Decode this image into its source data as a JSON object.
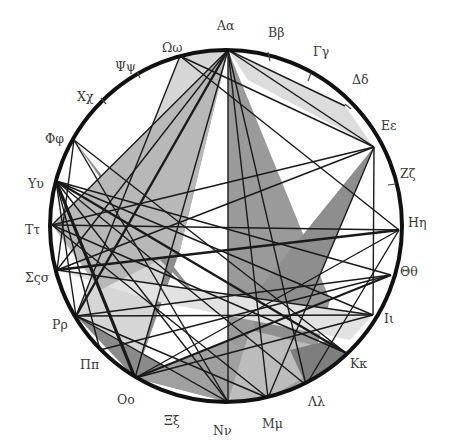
{
  "diagram": {
    "circle": {
      "cx": 226,
      "cy": 226,
      "r": 176,
      "stroke": "#111111",
      "stroke_width": 4
    },
    "labels": [
      {
        "text": "Αα",
        "x": 217,
        "y": 18
      },
      {
        "text": "Ββ",
        "x": 268,
        "y": 25
      },
      {
        "text": "Γγ",
        "x": 313,
        "y": 44
      },
      {
        "text": "Δδ",
        "x": 352,
        "y": 72
      },
      {
        "text": "Εε",
        "x": 381,
        "y": 118
      },
      {
        "text": "Ζζ",
        "x": 400,
        "y": 166
      },
      {
        "text": "Ηη",
        "x": 408,
        "y": 215
      },
      {
        "text": "Θθ",
        "x": 400,
        "y": 264
      },
      {
        "text": "Ιι",
        "x": 384,
        "y": 311
      },
      {
        "text": "Κκ",
        "x": 350,
        "y": 356
      },
      {
        "text": "Λλ",
        "x": 308,
        "y": 394
      },
      {
        "text": "Μμ",
        "x": 262,
        "y": 416
      },
      {
        "text": "Νν",
        "x": 213,
        "y": 423
      },
      {
        "text": "Ξξ",
        "x": 164,
        "y": 413
      },
      {
        "text": "Οο",
        "x": 117,
        "y": 392
      },
      {
        "text": "Ππ",
        "x": 80,
        "y": 357
      },
      {
        "text": "Ρρ",
        "x": 52,
        "y": 317
      },
      {
        "text": "Σςσ",
        "x": 25,
        "y": 270
      },
      {
        "text": "Ττ",
        "x": 25,
        "y": 222
      },
      {
        "text": "Υυ",
        "x": 28,
        "y": 176
      },
      {
        "text": "Φφ",
        "x": 45,
        "y": 131
      },
      {
        "text": "Χχ",
        "x": 77,
        "y": 89
      },
      {
        "text": "Ψψ",
        "x": 115,
        "y": 59
      },
      {
        "text": "Ωω",
        "x": 162,
        "y": 40
      }
    ],
    "ticks": [
      {
        "x1": 268,
        "y1": 52,
        "x2": 270,
        "y2": 61
      },
      {
        "x1": 311,
        "y1": 73,
        "x2": 308,
        "y2": 81
      },
      {
        "x1": 345,
        "y1": 104,
        "x2": 351,
        "y2": 109
      },
      {
        "x1": 388,
        "y1": 185,
        "x2": 396,
        "y2": 184
      },
      {
        "x1": 101,
        "y1": 98,
        "x2": 106,
        "y2": 104
      },
      {
        "x1": 137,
        "y1": 72,
        "x2": 140,
        "y2": 78
      }
    ],
    "vertices": {
      "A": [
        228,
        50
      ],
      "Om": [
        180,
        56
      ],
      "Ph": [
        74,
        140
      ],
      "Y": [
        56,
        181
      ],
      "T": [
        52,
        225
      ],
      "S": [
        57,
        270
      ],
      "R": [
        76,
        316
      ],
      "P": [
        100,
        350
      ],
      "O": [
        135,
        378
      ],
      "N": [
        228,
        402
      ],
      "M": [
        268,
        398
      ],
      "L": [
        306,
        385
      ],
      "K": [
        346,
        353
      ],
      "I": [
        373,
        315
      ],
      "Th": [
        391,
        275
      ],
      "H": [
        399,
        230
      ],
      "E": [
        374,
        147
      ],
      "D": [
        345,
        106
      ]
    },
    "polygons": [
      {
        "points": "228,50 345,106 374,147 248,80",
        "fill": "#dcdcdc"
      },
      {
        "points": "180,56 228,50 135,378 76,316",
        "fill": "#d6d6d6"
      },
      {
        "points": "228,50 228,402 306,385 330,300",
        "fill": "#9a9a9a"
      },
      {
        "points": "228,50 135,378 180,250",
        "fill": "#8c8c8c"
      },
      {
        "points": "74,140 200,300 150,250",
        "fill": "#8e8e8e"
      },
      {
        "points": "374,147 268,398 250,300",
        "fill": "#8e8e8e"
      },
      {
        "points": "57,270 373,315 350,340 150,300",
        "fill": "#e2e2e2"
      },
      {
        "points": "76,316 228,402 135,378",
        "fill": "#8a8a8a"
      },
      {
        "points": "135,378 228,402 268,398 306,385 228,340",
        "fill": "#a0a0a0"
      },
      {
        "points": "52,225 228,50 180,250 100,290",
        "fill": "#b8b8b8"
      },
      {
        "points": "228,402 268,398 346,353 250,330",
        "fill": "#bcbcbc"
      },
      {
        "points": "306,385 346,353 330,340 290,350",
        "fill": "#7e7e7e"
      }
    ],
    "chords": [
      {
        "a": "A",
        "b": "E",
        "w": 1.4
      },
      {
        "a": "A",
        "b": "D",
        "w": 1.4
      },
      {
        "a": "A",
        "b": "O",
        "w": 1.4
      },
      {
        "a": "A",
        "b": "N",
        "w": 1.4
      },
      {
        "a": "A",
        "b": "M",
        "w": 1.4
      },
      {
        "a": "A",
        "b": "L",
        "w": 1.4
      },
      {
        "a": "A",
        "b": "R",
        "w": 2.4
      },
      {
        "a": "A",
        "b": "T",
        "w": 1.4
      },
      {
        "a": "A",
        "b": "S",
        "w": 1.4
      },
      {
        "a": "Om",
        "b": "R",
        "w": 1.4
      },
      {
        "a": "Om",
        "b": "E",
        "w": 1.4
      },
      {
        "a": "Ph",
        "b": "K",
        "w": 1.4
      },
      {
        "a": "Y",
        "b": "O",
        "w": 3.2
      },
      {
        "a": "Y",
        "b": "K",
        "w": 2.4
      },
      {
        "a": "Y",
        "b": "I",
        "w": 1.4
      },
      {
        "a": "Y",
        "b": "Th",
        "w": 1.4
      },
      {
        "a": "Y",
        "b": "N",
        "w": 1.4
      },
      {
        "a": "Y",
        "b": "P",
        "w": 1.4
      },
      {
        "a": "Y",
        "b": "R",
        "w": 1.4
      },
      {
        "a": "T",
        "b": "H",
        "w": 1.4
      },
      {
        "a": "T",
        "b": "E",
        "w": 1.4
      },
      {
        "a": "T",
        "b": "M",
        "w": 1.4
      },
      {
        "a": "S",
        "b": "H",
        "w": 2.4
      },
      {
        "a": "S",
        "b": "I",
        "w": 1.4
      },
      {
        "a": "S",
        "b": "E",
        "w": 1.4
      },
      {
        "a": "S",
        "b": "Ph",
        "w": 1.4
      },
      {
        "a": "R",
        "b": "Th",
        "w": 1.4
      },
      {
        "a": "R",
        "b": "I",
        "w": 1.4
      },
      {
        "a": "R",
        "b": "N",
        "w": 1.4
      },
      {
        "a": "O",
        "b": "I",
        "w": 1.4
      },
      {
        "a": "O",
        "b": "H",
        "w": 1.4
      },
      {
        "a": "O",
        "b": "Th",
        "w": 2.0
      },
      {
        "a": "O",
        "b": "Y",
        "w": 1.4
      },
      {
        "a": "E",
        "b": "M",
        "w": 1.4
      },
      {
        "a": "E",
        "b": "I",
        "w": 1.4
      },
      {
        "a": "H",
        "b": "L",
        "w": 1.4
      },
      {
        "a": "H",
        "b": "Om",
        "w": 1.4
      },
      {
        "a": "N",
        "b": "Ph",
        "w": 1.4
      },
      {
        "a": "M",
        "b": "R",
        "w": 1.4
      },
      {
        "a": "K",
        "b": "T",
        "w": 1.4
      },
      {
        "a": "L",
        "b": "Y",
        "w": 1.4
      },
      {
        "a": "Th",
        "b": "P",
        "w": 1.4
      }
    ],
    "colors": {
      "line": "#1a1a1a",
      "label": "#3a3a3a",
      "background": "#ffffff"
    }
  }
}
